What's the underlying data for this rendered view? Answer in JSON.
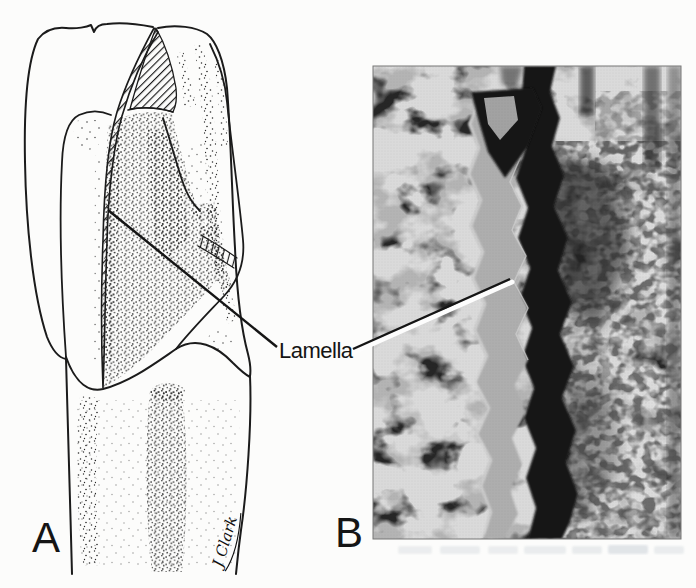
{
  "page": {
    "background_color": "#fcfcfb",
    "ink_color": "#1a1a1a"
  },
  "figure": {
    "annotation_label": "Lamella",
    "panel_a_label": "A",
    "panel_b_label": "B",
    "signature": "J Clark",
    "micrograph_grays": {
      "light": "#b2b2b2",
      "mid": "#8a8a8a",
      "dark": "#181818"
    }
  }
}
